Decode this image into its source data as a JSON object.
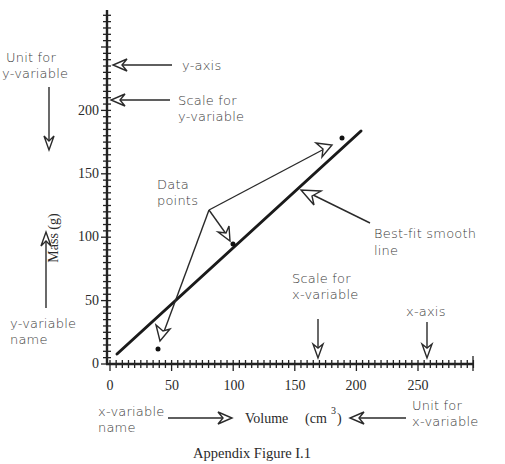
{
  "figure": {
    "caption": "Appendix Figure I.1"
  },
  "annotations": {
    "unit_y_line1": "Unit for",
    "unit_y_line2": "y-variable",
    "y_axis": "y-axis",
    "scale_y_line1": "Scale for",
    "scale_y_line2": "y-variable",
    "data_points_line1": "Data",
    "data_points_line2": "points",
    "best_fit_line1": "Best-fit smooth",
    "best_fit_line2": "line",
    "scale_x_line1": "Scale for",
    "scale_x_line2": "x-variable",
    "x_axis": "x-axis",
    "y_var_name_line1": "y-variable",
    "y_var_name_line2": "name",
    "x_var_name_line1": "x-variable",
    "x_var_name_line2": "name",
    "unit_x_line1": "Unit for",
    "unit_x_line2": "x-variable"
  },
  "axes": {
    "x_label": "Volume",
    "x_unit": "(cm",
    "x_unit_sup": "3",
    "x_unit_close": ")",
    "y_label": "Mass  (g)",
    "x_ticks": [
      "0",
      "50",
      "100",
      "150",
      "200",
      "250"
    ],
    "y_ticks": [
      "0",
      "50",
      "100",
      "150",
      "200"
    ]
  },
  "chart_data": {
    "type": "scatter",
    "title": "Appendix Figure I.1",
    "xlabel": "Volume (cm³)",
    "ylabel": "Mass (g)",
    "xlim": [
      0,
      290
    ],
    "ylim": [
      0,
      280
    ],
    "x_ticks": [
      0,
      50,
      100,
      150,
      200,
      250
    ],
    "y_ticks": [
      0,
      50,
      100,
      150,
      200
    ],
    "grid": false,
    "series": [
      {
        "name": "Data points",
        "x": [
          39,
          100,
          189
        ],
        "y": [
          11,
          94,
          177
        ]
      },
      {
        "name": "Best-fit smooth line",
        "type": "line",
        "x": [
          6,
          203
        ],
        "y": [
          7,
          183
        ]
      }
    ],
    "annotations": [
      "Unit for y-variable",
      "y-axis",
      "Scale for y-variable",
      "Data points",
      "Best-fit smooth line",
      "Scale for x-variable",
      "x-axis",
      "y-variable name",
      "x-variable name",
      "Unit for x-variable"
    ]
  }
}
